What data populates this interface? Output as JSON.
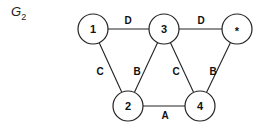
{
  "title": {
    "base": "G",
    "subscript": "2"
  },
  "nodes": [
    {
      "id": "1",
      "label": "1",
      "x": 93,
      "y": 29
    },
    {
      "id": "3",
      "label": "3",
      "x": 164,
      "y": 29
    },
    {
      "id": "star",
      "label": "*",
      "x": 237,
      "y": 29
    },
    {
      "id": "2",
      "label": "2",
      "x": 128,
      "y": 106
    },
    {
      "id": "4",
      "label": "4",
      "x": 200,
      "y": 106
    }
  ],
  "node_radius": 15,
  "edges": [
    {
      "from": "1",
      "to": "3",
      "label": "D",
      "lx": 128,
      "ly": 20
    },
    {
      "from": "3",
      "to": "star",
      "label": "D",
      "lx": 201,
      "ly": 20
    },
    {
      "from": "1",
      "to": "2",
      "label": "C",
      "lx": 100,
      "ly": 71
    },
    {
      "from": "3",
      "to": "2",
      "label": "B",
      "lx": 137,
      "ly": 71
    },
    {
      "from": "3",
      "to": "4",
      "label": "C",
      "lx": 176,
      "ly": 71
    },
    {
      "from": "star",
      "to": "4",
      "label": "B",
      "lx": 213,
      "ly": 71
    },
    {
      "from": "2",
      "to": "4",
      "label": "A",
      "lx": 165,
      "ly": 115
    }
  ],
  "colors": {
    "stroke": "#222222",
    "background": "#ffffff"
  }
}
